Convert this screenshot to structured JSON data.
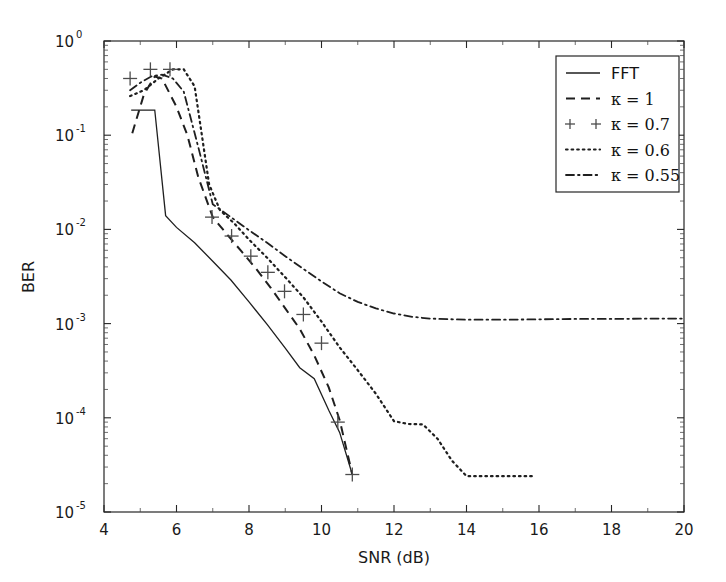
{
  "chart_data": {
    "type": "line",
    "title": "",
    "xlabel": "SNR (dB)",
    "ylabel": "BER",
    "xlim": [
      4,
      20
    ],
    "ylim": [
      1e-05,
      1
    ],
    "yscale": "log",
    "xscale": "linear",
    "grid": false,
    "legend_position": "upper right",
    "xticks": [
      "4",
      "6",
      "8",
      "10",
      "12",
      "14",
      "16",
      "18",
      "20"
    ],
    "xtick_values": [
      4,
      6,
      8,
      10,
      12,
      14,
      16,
      18,
      20
    ],
    "yticks": [
      "10^0",
      "10^-1",
      "10^-2",
      "10^-3",
      "10^-4",
      "10^-5"
    ],
    "ytick_mantissa": [
      "10",
      "10",
      "10",
      "10",
      "10",
      "10"
    ],
    "ytick_exponent": [
      "0",
      "-1",
      "-2",
      "-3",
      "-4",
      "-5"
    ],
    "ytick_values": [
      1,
      0.1,
      0.01,
      0.001,
      0.0001,
      1e-05
    ],
    "series": [
      {
        "name": "FFT",
        "linestyle": "solid",
        "marker": "none",
        "color": "#1f1f1f",
        "x": [
          4.75,
          5.4,
          5.7,
          6.0,
          6.5,
          7.0,
          7.5,
          8.0,
          8.5,
          9.0,
          9.4,
          9.8,
          10.2,
          10.5,
          10.85
        ],
        "y": [
          0.185,
          0.185,
          0.014,
          0.0105,
          0.0072,
          0.0046,
          0.0029,
          0.0017,
          0.00098,
          0.00055,
          0.00034,
          0.00026,
          0.00012,
          7e-05,
          2.5e-05
        ]
      },
      {
        "name": "κ = 1",
        "linestyle": "dashed",
        "marker": "none",
        "color": "#1f1f1f",
        "x": [
          4.78,
          5.1,
          5.4,
          5.6,
          6.0,
          6.3,
          6.6,
          7.0,
          7.4,
          7.8,
          8.2,
          8.6,
          9.0,
          9.4,
          9.8,
          10.2,
          10.5,
          10.85
        ],
        "y": [
          0.105,
          0.27,
          0.42,
          0.4,
          0.2,
          0.1,
          0.036,
          0.0135,
          0.0088,
          0.0058,
          0.0038,
          0.0024,
          0.00145,
          0.00088,
          0.00046,
          0.00021,
          9.5e-05,
          2.5e-05
        ]
      },
      {
        "name": "κ = 0.7",
        "linestyle": "none",
        "marker": "+",
        "color": "#4c4c4c",
        "x": [
          4.72,
          5.28,
          5.82,
          6.98,
          7.52,
          8.05,
          8.52,
          8.98,
          9.5,
          10.0,
          10.45,
          10.85
        ],
        "y": [
          0.4,
          0.5,
          0.5,
          0.0135,
          0.0085,
          0.0052,
          0.0035,
          0.0022,
          0.00125,
          0.00062,
          9e-05,
          2.5e-05
        ]
      },
      {
        "name": "κ = 0.6",
        "linestyle": "dotted",
        "marker": "none",
        "color": "#1f1f1f",
        "x": [
          4.72,
          5.1,
          5.5,
          5.9,
          6.2,
          6.5,
          6.7,
          6.9,
          7.2,
          7.6,
          8.0,
          8.5,
          9.0,
          9.5,
          10.0,
          10.5,
          11.0,
          11.5,
          12.0,
          12.4,
          12.8,
          13.2,
          13.6,
          14.0,
          14.6,
          15.2,
          15.9
        ],
        "y": [
          0.26,
          0.3,
          0.4,
          0.5,
          0.5,
          0.33,
          0.1,
          0.03,
          0.016,
          0.0115,
          0.0078,
          0.005,
          0.0031,
          0.0019,
          0.00105,
          0.00056,
          0.00032,
          0.00018,
          9.2e-05,
          8.6e-05,
          8.5e-05,
          6e-05,
          3.5e-05,
          2.4e-05,
          2.4e-05,
          2.4e-05,
          2.4e-05
        ]
      },
      {
        "name": "κ = 0.55",
        "linestyle": "dashdot",
        "marker": "none",
        "color": "#1f1f1f",
        "x": [
          4.72,
          5.0,
          5.3,
          5.6,
          5.9,
          6.2,
          6.6,
          7.0,
          7.5,
          8.0,
          8.5,
          9.0,
          9.5,
          10.0,
          10.5,
          11.0,
          11.5,
          12.0,
          12.5,
          13.0,
          14.0,
          15.0,
          16.0,
          17.0,
          18.0,
          19.0,
          20.0
        ],
        "y": [
          0.3,
          0.36,
          0.42,
          0.44,
          0.4,
          0.29,
          0.075,
          0.0185,
          0.0135,
          0.0098,
          0.0072,
          0.0052,
          0.0038,
          0.0028,
          0.0021,
          0.0017,
          0.00145,
          0.00128,
          0.00118,
          0.00113,
          0.0011,
          0.0011,
          0.00111,
          0.00112,
          0.00112,
          0.00113,
          0.00113
        ]
      }
    ]
  },
  "legend": {
    "entries": [
      {
        "label": "FFT",
        "style": "solid"
      },
      {
        "label": "κ = 1",
        "style": "dashed"
      },
      {
        "label": "κ = 0.7",
        "style": "plus"
      },
      {
        "label": "κ = 0.6",
        "style": "dotted"
      },
      {
        "label": "κ = 0.55",
        "style": "dashdot"
      }
    ]
  },
  "axes": {
    "x_label": "SNR (dB)",
    "y_label": "BER"
  }
}
